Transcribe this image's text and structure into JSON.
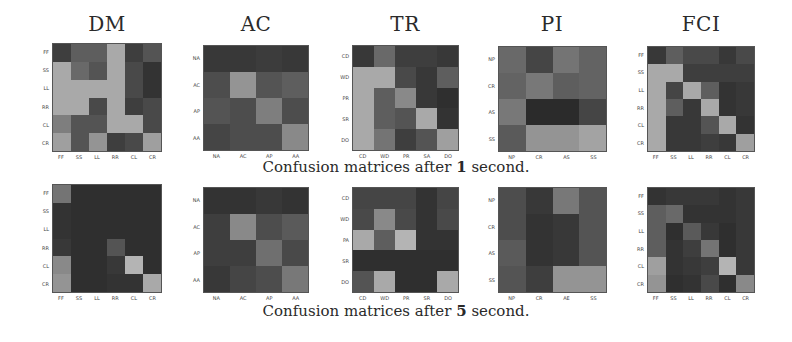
{
  "chart_data": [
    {
      "type": "heatmap",
      "title": "DM",
      "row": "after 1 second",
      "labels_y": [
        "FF",
        "SS",
        "LL",
        "RR",
        "CL",
        "CR"
      ],
      "labels_x": [
        "FF",
        "SS",
        "LL",
        "RR",
        "CL",
        "CR"
      ],
      "values": [
        [
          0.15,
          0.3,
          0.3,
          0.65,
          0.15,
          0.25
        ],
        [
          0.65,
          0.35,
          0.25,
          0.65,
          0.2,
          0.1
        ],
        [
          0.65,
          0.65,
          0.65,
          0.65,
          0.2,
          0.1
        ],
        [
          0.65,
          0.65,
          0.2,
          0.65,
          0.15,
          0.2
        ],
        [
          0.45,
          0.25,
          0.25,
          0.65,
          0.65,
          0.2
        ],
        [
          0.6,
          0.25,
          0.55,
          0.15,
          0.2,
          0.6
        ]
      ]
    },
    {
      "type": "heatmap",
      "title": "AC",
      "row": "after 1 second",
      "labels_y": [
        "NA",
        "AC",
        "AP",
        "AA"
      ],
      "labels_x": [
        "NA",
        "AC",
        "AP",
        "AA"
      ],
      "values": [
        [
          0.12,
          0.12,
          0.14,
          0.12
        ],
        [
          0.22,
          0.55,
          0.25,
          0.3
        ],
        [
          0.25,
          0.22,
          0.45,
          0.22
        ],
        [
          0.18,
          0.22,
          0.22,
          0.5
        ]
      ]
    },
    {
      "type": "heatmap",
      "title": "TR",
      "row": "after 1 second",
      "labels_y": [
        "CD",
        "WD",
        "PR",
        "SR",
        "DO"
      ],
      "labels_x": [
        "CD",
        "WD",
        "PR",
        "SA",
        "DO"
      ],
      "values": [
        [
          0.12,
          0.35,
          0.15,
          0.15,
          0.12
        ],
        [
          0.65,
          0.65,
          0.2,
          0.12,
          0.3
        ],
        [
          0.65,
          0.3,
          0.5,
          0.12,
          0.08
        ],
        [
          0.65,
          0.3,
          0.25,
          0.65,
          0.1
        ],
        [
          0.65,
          0.4,
          0.15,
          0.25,
          0.6
        ]
      ]
    },
    {
      "type": "heatmap",
      "title": "PI",
      "row": "after 1 second",
      "labels_y": [
        "NP",
        "CR",
        "AS",
        "SS"
      ],
      "labels_x": [
        "NP",
        "CR",
        "AS",
        "SS"
      ],
      "values": [
        [
          0.35,
          0.18,
          0.4,
          0.32
        ],
        [
          0.32,
          0.42,
          0.3,
          0.32
        ],
        [
          0.42,
          0.06,
          0.06,
          0.18
        ],
        [
          0.28,
          0.55,
          0.55,
          0.62
        ]
      ]
    },
    {
      "type": "heatmap",
      "title": "FCI",
      "row": "after 1 second",
      "labels_y": [
        "FF",
        "SS",
        "LL",
        "RR",
        "CL",
        "CR"
      ],
      "labels_x": [
        "FF",
        "SS",
        "LL",
        "RR",
        "CL",
        "CR"
      ],
      "values": [
        [
          0.12,
          0.3,
          0.2,
          0.2,
          0.12,
          0.2
        ],
        [
          0.65,
          0.65,
          0.15,
          0.15,
          0.15,
          0.15
        ],
        [
          0.65,
          0.18,
          0.65,
          0.3,
          0.1,
          0.12
        ],
        [
          0.65,
          0.3,
          0.12,
          0.65,
          0.1,
          0.12
        ],
        [
          0.65,
          0.12,
          0.12,
          0.25,
          0.65,
          0.1
        ],
        [
          0.65,
          0.12,
          0.12,
          0.15,
          0.12,
          0.6
        ]
      ]
    },
    {
      "type": "heatmap",
      "title": "DM",
      "row": "after 5 second",
      "labels_y": [
        "FF",
        "SS",
        "LL",
        "RR",
        "CL",
        "CR"
      ],
      "labels_x": [
        "FF",
        "SS",
        "LL",
        "RR",
        "CL",
        "CR"
      ],
      "values": [
        [
          0.4,
          0.08,
          0.08,
          0.08,
          0.08,
          0.08
        ],
        [
          0.1,
          0.08,
          0.08,
          0.08,
          0.08,
          0.08
        ],
        [
          0.1,
          0.08,
          0.08,
          0.08,
          0.08,
          0.08
        ],
        [
          0.12,
          0.08,
          0.08,
          0.25,
          0.08,
          0.08
        ],
        [
          0.5,
          0.08,
          0.08,
          0.12,
          0.7,
          0.08
        ],
        [
          0.55,
          0.08,
          0.08,
          0.1,
          0.1,
          0.65
        ]
      ]
    },
    {
      "type": "heatmap",
      "title": "AC",
      "row": "after 5 second",
      "labels_y": [
        "NA",
        "AC",
        "AP",
        "AA"
      ],
      "labels_x": [
        "NA",
        "AC",
        "AP",
        "AA"
      ],
      "values": [
        [
          0.1,
          0.1,
          0.12,
          0.1
        ],
        [
          0.15,
          0.5,
          0.22,
          0.28
        ],
        [
          0.15,
          0.15,
          0.38,
          0.2
        ],
        [
          0.12,
          0.18,
          0.22,
          0.42
        ]
      ]
    },
    {
      "type": "heatmap",
      "title": "TR",
      "row": "after 5 second",
      "labels_y": [
        "CD",
        "WD",
        "PA",
        "SR",
        "DO"
      ],
      "labels_x": [
        "CD",
        "WD",
        "PR",
        "SR",
        "DO"
      ],
      "values": [
        [
          0.18,
          0.18,
          0.18,
          0.1,
          0.18
        ],
        [
          0.2,
          0.5,
          0.2,
          0.1,
          0.2
        ],
        [
          0.65,
          0.3,
          0.7,
          0.1,
          0.1
        ],
        [
          0.08,
          0.08,
          0.08,
          0.08,
          0.08
        ],
        [
          0.25,
          0.65,
          0.08,
          0.08,
          0.65
        ]
      ]
    },
    {
      "type": "heatmap",
      "title": "PI",
      "row": "after 5 second",
      "labels_y": [
        "NP",
        "CR",
        "AS",
        "SS"
      ],
      "labels_x": [
        "NP",
        "CR",
        "AE",
        "SS"
      ],
      "values": [
        [
          0.22,
          0.12,
          0.42,
          0.25
        ],
        [
          0.22,
          0.1,
          0.12,
          0.25
        ],
        [
          0.28,
          0.1,
          0.12,
          0.25
        ],
        [
          0.25,
          0.15,
          0.55,
          0.55
        ]
      ]
    },
    {
      "type": "heatmap",
      "title": "FCI",
      "row": "after 5 second",
      "labels_y": [
        "FF",
        "SS",
        "LL",
        "RR",
        "CL",
        "CR"
      ],
      "labels_x": [
        "FF",
        "SS",
        "LL",
        "RR",
        "CL",
        "CR"
      ],
      "values": [
        [
          0.1,
          0.12,
          0.12,
          0.12,
          0.1,
          0.12
        ],
        [
          0.3,
          0.35,
          0.1,
          0.1,
          0.1,
          0.12
        ],
        [
          0.3,
          0.08,
          0.28,
          0.12,
          0.08,
          0.12
        ],
        [
          0.3,
          0.1,
          0.15,
          0.4,
          0.08,
          0.12
        ],
        [
          0.6,
          0.1,
          0.12,
          0.15,
          0.7,
          0.12
        ],
        [
          0.55,
          0.08,
          0.1,
          0.2,
          0.08,
          0.5
        ]
      ]
    }
  ],
  "titles": [
    "DM",
    "AC",
    "TR",
    "PI",
    "FCI"
  ],
  "captions": {
    "top": {
      "prefix": "Confusion matrices after ",
      "num": "1",
      "suffix": " second."
    },
    "bottom": {
      "prefix": "Confusion matrices after ",
      "num": "5",
      "suffix": " second."
    }
  },
  "colormap": {
    "dark": "#1e1e1e",
    "light": "#b4b4b4"
  }
}
